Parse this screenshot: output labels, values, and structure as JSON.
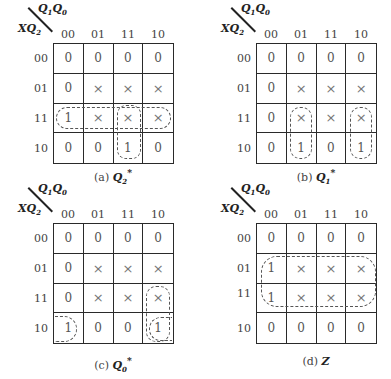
{
  "col_var_label": "Q1Q0",
  "row_var_label": "XQ2",
  "col_headers": [
    "00",
    "01",
    "11",
    "10"
  ],
  "row_headers": [
    "00",
    "01",
    "11",
    "10"
  ],
  "maps": [
    {
      "id": "a",
      "caption_prefix": "(a)",
      "caption_var": "Q",
      "caption_sub": "2",
      "caption_sup": "*",
      "cells": [
        [
          "0",
          "0",
          "0",
          "0"
        ],
        [
          "0",
          "×",
          "×",
          "×"
        ],
        [
          "1",
          "×",
          "×",
          "×"
        ],
        [
          "0",
          "0",
          "1",
          "0"
        ]
      ],
      "loops": [
        "row 11 (all columns)",
        "column 11 rows 11-10"
      ]
    },
    {
      "id": "b",
      "caption_prefix": "(b)",
      "caption_var": "Q",
      "caption_sub": "1",
      "caption_sup": "*",
      "cells": [
        [
          "0",
          "0",
          "0",
          "0"
        ],
        [
          "0",
          "×",
          "×",
          "×"
        ],
        [
          "0",
          "×",
          "×",
          "×"
        ],
        [
          "0",
          "1",
          "0",
          "1"
        ]
      ],
      "loops": [
        "column 01 rows 11-10",
        "column 10 rows 11-10"
      ]
    },
    {
      "id": "c",
      "caption_prefix": "(c)",
      "caption_var": "Q",
      "caption_sub": "0",
      "caption_sup": "*",
      "cells": [
        [
          "0",
          "0",
          "0",
          "0"
        ],
        [
          "0",
          "×",
          "×",
          "×"
        ],
        [
          "0",
          "×",
          "×",
          "×"
        ],
        [
          "1",
          "0",
          "0",
          "1"
        ]
      ],
      "loops": [
        "column 10 rows 11-10",
        "row 10 columns 00 and 10 (wrap)"
      ]
    },
    {
      "id": "d",
      "caption_prefix": "(d)",
      "caption_var": "Z",
      "caption_sub": "",
      "caption_sup": "",
      "cells": [
        [
          "0",
          "0",
          "0",
          "0"
        ],
        [
          "1",
          "×",
          "×",
          "×"
        ],
        [
          "1",
          "×",
          "×",
          "×"
        ],
        [
          "0",
          "0",
          "0",
          "0"
        ]
      ],
      "loops": [
        "rows 01-11 (all columns)"
      ]
    }
  ]
}
